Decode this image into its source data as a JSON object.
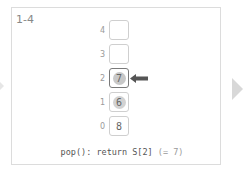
{
  "slide": {
    "step_label": "1-4",
    "caption_code": "pop(): return S[2]",
    "caption_note": "(= 7)"
  },
  "stack": {
    "cells": [
      {
        "index": "4",
        "value": "",
        "highlight": false,
        "active": false
      },
      {
        "index": "3",
        "value": "",
        "highlight": false,
        "active": false
      },
      {
        "index": "2",
        "value": "7",
        "highlight": true,
        "active": true
      },
      {
        "index": "1",
        "value": "6",
        "highlight": true,
        "active": false
      },
      {
        "index": "0",
        "value": "8",
        "highlight": false,
        "active": false
      }
    ],
    "pointer_target_index": "2"
  },
  "nav": {
    "prev_icon": "triangle-left-icon",
    "next_icon": "triangle-right-icon"
  },
  "colors": {
    "frame_border": "#dcdcdc",
    "cell_border": "#cfcfcf",
    "active_border": "#7a7a7a",
    "highlight": "#c8c8c8",
    "arrow": "#555555",
    "next_arrow": "#d8d8d8"
  }
}
